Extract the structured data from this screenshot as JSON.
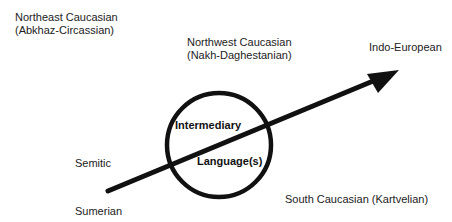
{
  "diagram": {
    "labels": {
      "northeast_caucasian_line1": "Northeast Caucasian",
      "northeast_caucasian_line2": "(Abkhaz-Circassian)",
      "northwest_caucasian_line1": "Northwest Caucasian",
      "northwest_caucasian_line2": "(Nakh-Daghestanian)",
      "indo_european": "Indo-European",
      "intermediary": "Intermediary",
      "languages": "Language(s)",
      "semitic": "Semitic",
      "sumerian": "Sumerian",
      "south_caucasian": "South Caucasian (Kartvelian)"
    },
    "circle": {
      "cx": 219,
      "cy": 145,
      "r": 52,
      "stroke": "#111111"
    },
    "arrow": {
      "x1": 108,
      "y1": 192,
      "x2": 398,
      "y2": 70,
      "stroke": "#111111"
    }
  }
}
